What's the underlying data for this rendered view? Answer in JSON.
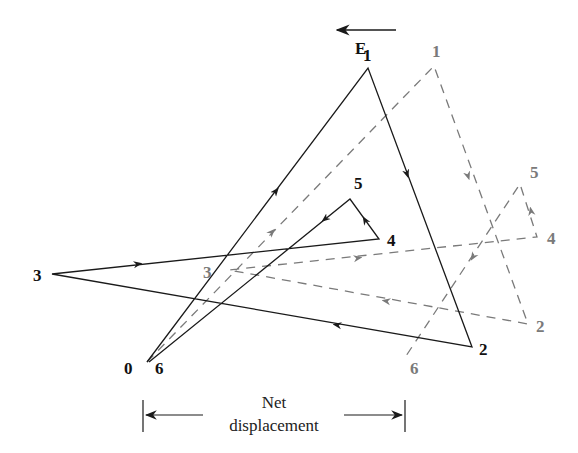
{
  "field": {
    "label": "E",
    "direction": "left"
  },
  "solid_path": {
    "color": "#1a1a1a",
    "labels": {
      "v0": "0",
      "v1": "1",
      "v2": "2",
      "v3": "3",
      "v4": "4",
      "v5": "5",
      "v6": "6"
    }
  },
  "dashed_path": {
    "color": "#7a7a7a",
    "labels": {
      "v1": "1",
      "v2": "2",
      "v3": "3",
      "v4": "4",
      "v5": "5",
      "v6": "6"
    }
  },
  "net_displacement": {
    "line1": "Net",
    "line2": "displacement"
  }
}
